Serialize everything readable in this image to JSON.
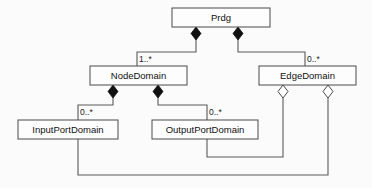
{
  "diagram": {
    "type": "uml-class-diagram",
    "canvas": {
      "width": 372,
      "height": 188,
      "background": "#fbfbfb"
    },
    "style": {
      "box_fill": "#fdfdfd",
      "box_stroke": "#4a4a4a",
      "line_stroke": "#5a5a5a",
      "filled_diamond": "#111111",
      "hollow_diamond_fill": "#ffffff",
      "text_color": "#111111"
    },
    "classes": [
      {
        "id": "prdg",
        "name": "Prdg",
        "x": 172,
        "y": 8,
        "w": 98,
        "h": 19
      },
      {
        "id": "nodedomain",
        "name": "NodeDomain",
        "x": 90,
        "y": 66,
        "w": 97,
        "h": 19
      },
      {
        "id": "edgedomain",
        "name": "EdgeDomain",
        "x": 259,
        "y": 66,
        "w": 97,
        "h": 19
      },
      {
        "id": "inputportdomain",
        "name": "InputPortDomain",
        "x": 18,
        "y": 120,
        "w": 100,
        "h": 19
      },
      {
        "id": "outputportdomain",
        "name": "OutputPortDomain",
        "x": 152,
        "y": 120,
        "w": 106,
        "h": 19
      }
    ],
    "relationships": [
      {
        "id": "prdg-nodedomain",
        "from": "prdg",
        "to": "nodedomain",
        "kind": "composition",
        "diamond": "filled",
        "multiplicity": "1..*",
        "label_x": 139,
        "label_y": 60
      },
      {
        "id": "prdg-edgedomain",
        "from": "prdg",
        "to": "edgedomain",
        "kind": "composition",
        "diamond": "filled",
        "multiplicity": "0..*",
        "label_x": 307,
        "label_y": 60
      },
      {
        "id": "nodedomain-inputportdomain",
        "from": "nodedomain",
        "to": "inputportdomain",
        "kind": "composition",
        "diamond": "filled",
        "multiplicity": "0..*",
        "label_x": 80,
        "label_y": 113
      },
      {
        "id": "nodedomain-outputportdomain",
        "from": "nodedomain",
        "to": "outputportdomain",
        "kind": "composition",
        "diamond": "filled",
        "multiplicity": "0..*",
        "label_x": 209,
        "label_y": 113
      },
      {
        "id": "edgedomain-outputportdomain",
        "from": "edgedomain",
        "to": "outputportdomain",
        "kind": "aggregation",
        "diamond": "hollow",
        "multiplicity": "",
        "label_x": 0,
        "label_y": 0
      },
      {
        "id": "edgedomain-inputportdomain",
        "from": "edgedomain",
        "to": "inputportdomain",
        "kind": "aggregation",
        "diamond": "hollow",
        "multiplicity": "",
        "label_x": 0,
        "label_y": 0
      }
    ]
  }
}
